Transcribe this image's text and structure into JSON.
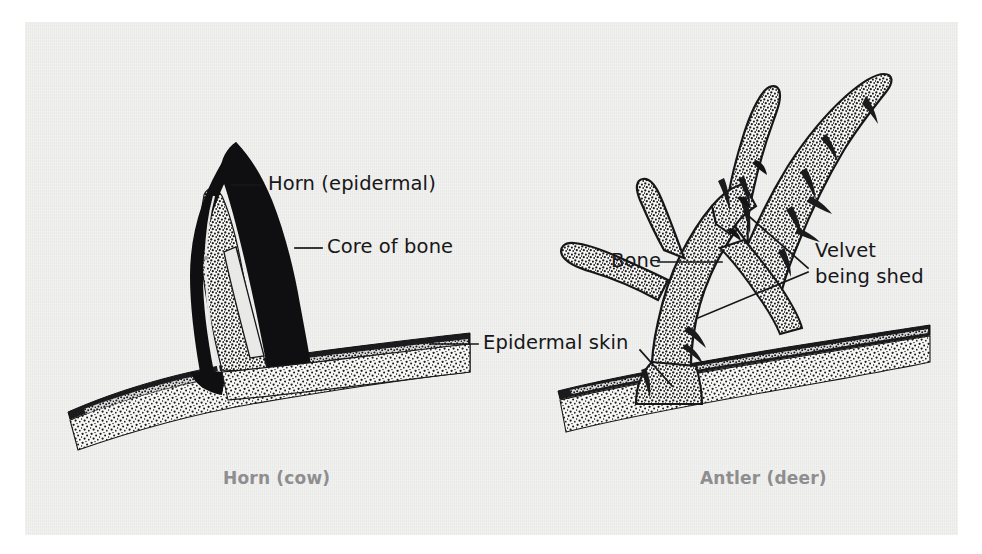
{
  "figure": {
    "title_hidden": "",
    "background_color": "#e9e9e7",
    "ink_color": "#17171a",
    "caption_color": "#8e8e90"
  },
  "panels": {
    "left": {
      "caption": "Horn (cow)",
      "subject": "horn-cow"
    },
    "right": {
      "caption": "Antler (deer)",
      "subject": "antler-deer"
    }
  },
  "labels": [
    {
      "id": "horn-epidermal",
      "text": "Horn (epidermal)",
      "side": "left"
    },
    {
      "id": "core-of-bone",
      "text": "Core of bone",
      "side": "left"
    },
    {
      "id": "epidermal-skin",
      "text": "Epidermal skin",
      "side": "center"
    },
    {
      "id": "bone",
      "text": "Bone",
      "side": "right"
    },
    {
      "id": "velvet-line1",
      "text": "Velvet",
      "side": "right"
    },
    {
      "id": "velvet-line2",
      "text": "being shed",
      "side": "right"
    }
  ],
  "structures": {
    "horn_sheath": "solid black keratin sheath",
    "bone_core": "stippled bone core inside horn",
    "skull_bone": "stippled cranial bone band",
    "skin_band": "dark epidermal skin layer over skull",
    "antler_bone": "stippled antler bone",
    "velvet_strips": "ragged velvet strips peeling from tines"
  }
}
